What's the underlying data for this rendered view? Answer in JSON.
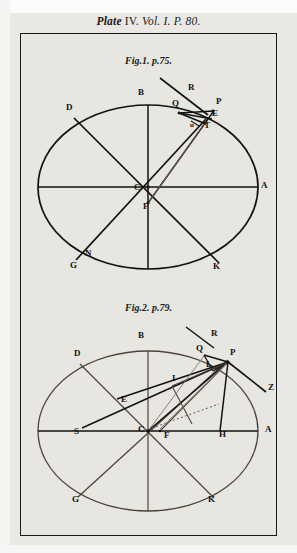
{
  "plate": {
    "title_main": "Plate",
    "title_number": "IV.",
    "title_vol": "Vol.",
    "title_vol_number": "I.",
    "title_page_prefix": "P.",
    "title_page_number": "80.",
    "full_title": "Plate IV. Vol. I. P. 80.",
    "ink_color": "#14120f",
    "paper_color": "#e9e8e4",
    "frame_color": "#1b1917"
  },
  "figures": [
    {
      "id": "fig1",
      "caption": "Fig. 1. p. 75.",
      "caption_fig": "Fig.1.",
      "caption_page": "p.75.",
      "labels": [
        {
          "text": "B",
          "x": 138,
          "y": 95,
          "name": "point-b"
        },
        {
          "text": "D",
          "x": 66,
          "y": 110,
          "name": "point-d"
        },
        {
          "text": "R",
          "x": 188,
          "y": 90,
          "name": "point-r"
        },
        {
          "text": "Q",
          "x": 172,
          "y": 106,
          "name": "point-q"
        },
        {
          "text": "P",
          "x": 216,
          "y": 104,
          "name": "point-p"
        },
        {
          "text": "E",
          "x": 212,
          "y": 116,
          "name": "point-e"
        },
        {
          "text": "T",
          "x": 204,
          "y": 128,
          "name": "point-t"
        },
        {
          "text": "u",
          "x": 190,
          "y": 127,
          "name": "point-u"
        },
        {
          "text": "A",
          "x": 261,
          "y": 188,
          "name": "point-a"
        },
        {
          "text": "C",
          "x": 134,
          "y": 190,
          "name": "point-c"
        },
        {
          "text": "F",
          "x": 143,
          "y": 209,
          "name": "point-f"
        },
        {
          "text": "N",
          "x": 85,
          "y": 256,
          "name": "point-n"
        },
        {
          "text": "G",
          "x": 70,
          "y": 268,
          "name": "point-g"
        },
        {
          "text": "K",
          "x": 213,
          "y": 269,
          "name": "point-k"
        }
      ]
    },
    {
      "id": "fig2",
      "caption": "Fig. 2. p. 79.",
      "caption_fig": "Fig.2.",
      "caption_page": "p.79.",
      "labels": [
        {
          "text": "B",
          "x": 138,
          "y": 338,
          "name": "point-b"
        },
        {
          "text": "D",
          "x": 74,
          "y": 356,
          "name": "point-d"
        },
        {
          "text": "R",
          "x": 211,
          "y": 336,
          "name": "point-r"
        },
        {
          "text": "Q",
          "x": 196,
          "y": 351,
          "name": "point-q"
        },
        {
          "text": "P",
          "x": 230,
          "y": 355,
          "name": "point-p"
        },
        {
          "text": "L",
          "x": 206,
          "y": 367,
          "name": "point-l"
        },
        {
          "text": "Z",
          "x": 268,
          "y": 390,
          "name": "point-z"
        },
        {
          "text": "I",
          "x": 172,
          "y": 381,
          "name": "point-i"
        },
        {
          "text": "E",
          "x": 121,
          "y": 402,
          "name": "point-e"
        },
        {
          "text": "S",
          "x": 74,
          "y": 434,
          "name": "point-s"
        },
        {
          "text": "C",
          "x": 138,
          "y": 432,
          "name": "point-c"
        },
        {
          "text": "F",
          "x": 164,
          "y": 438,
          "name": "point-f"
        },
        {
          "text": "H",
          "x": 219,
          "y": 437,
          "name": "point-h"
        },
        {
          "text": "A",
          "x": 265,
          "y": 432,
          "name": "point-a"
        },
        {
          "text": "G",
          "x": 72,
          "y": 502,
          "name": "point-g"
        },
        {
          "text": "K",
          "x": 208,
          "y": 502,
          "name": "point-k"
        }
      ]
    }
  ]
}
